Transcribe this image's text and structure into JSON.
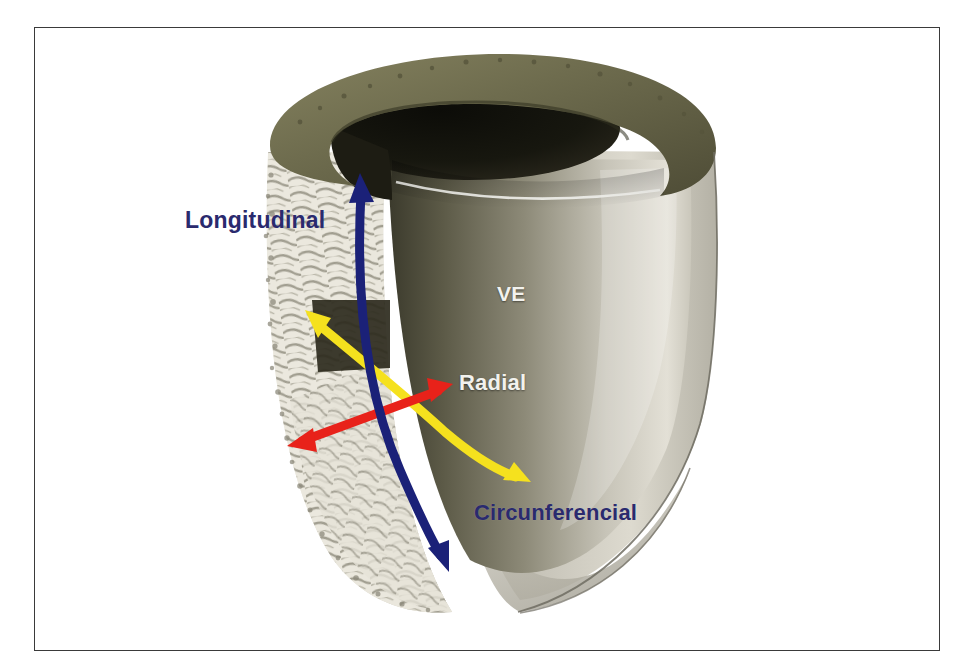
{
  "figure": {
    "title": "",
    "background_color": "#ffffff",
    "frame_color": "#3a3a3a"
  },
  "anatomy": {
    "chamber_label": "VE",
    "chamber_label_color": "#f2f2ee",
    "epicardium_rim_color": "#6e6c4e",
    "cavity_color": "#171711",
    "endocardium_color": "#cfcdc4",
    "myocardial_fiber_color": "#e9e7dd",
    "outer_wall_color": "#b9b6ab"
  },
  "arrows": [
    {
      "id": "longitudinal",
      "label": "Longitudinal",
      "label_color": "#2a2a6e",
      "color": "#1b2178",
      "heads": "double",
      "shape": "curved",
      "from": [
        360,
        175
      ],
      "to": [
        447,
        570
      ]
    },
    {
      "id": "radial",
      "label": "Radial",
      "label_color": "#f2f2ee",
      "color": "#e8221a",
      "heads": "double",
      "shape": "straight",
      "from": [
        288,
        445
      ],
      "to": [
        452,
        385
      ]
    },
    {
      "id": "circunferencial",
      "label": "Circunferencial",
      "label_color": "#2a2a6e",
      "color": "#f5e11e",
      "heads": "double",
      "shape": "curved",
      "from": [
        307,
        312
      ],
      "to": [
        527,
        480
      ]
    }
  ]
}
